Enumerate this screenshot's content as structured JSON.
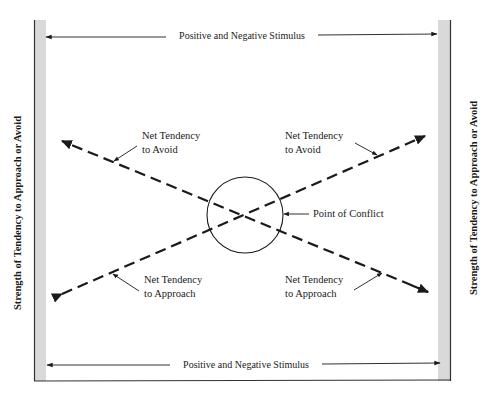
{
  "diagram": {
    "top_axis_label": "Positive and Negative Stimulus",
    "bottom_axis_label": "Positive and Negative Stimulus",
    "left_axis_label": "Strength of Tendency to Approach or Avoid",
    "right_axis_label": "Strength of Tendency to Approach or Avoid",
    "annotations": {
      "upper_left": {
        "line1": "Net Tendency",
        "line2": "to Avoid"
      },
      "upper_right": {
        "line1": "Net Tendency",
        "line2": "to Avoid"
      },
      "lower_left": {
        "line1": "Net Tendency",
        "line2": "to Approach"
      },
      "lower_right": {
        "line1": "Net Tendency",
        "line2": "to Approach"
      },
      "center": "Point of Conflict"
    },
    "colors": {
      "ink": "#1a1a1a",
      "side_strip": "#d9d9d9",
      "background": "#ffffff"
    }
  }
}
